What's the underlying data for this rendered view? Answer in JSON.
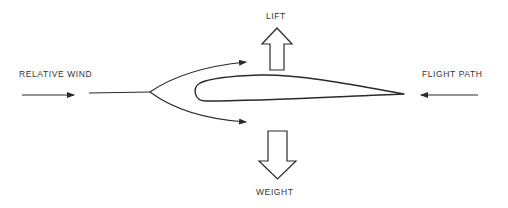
{
  "labels": {
    "lift": "LIFT",
    "weight": "WEIGHT",
    "relative_wind": "RELATIVE WIND",
    "flight_path": "FLIGHT PATH"
  },
  "colors": {
    "stroke": "#2a2a2a",
    "text": "#333333",
    "background": "#ffffff"
  }
}
